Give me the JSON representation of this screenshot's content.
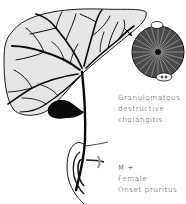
{
  "figure": {
    "colors": {
      "liver_fill": "#e6e6e6",
      "ink": "#0a0a0a",
      "section_fill": "#4a4a4a",
      "background": "#ffffff"
    },
    "icons": {
      "liver": "liver-outline",
      "biliary_tree": "bile-duct-tree",
      "gallbladder": "gallbladder-shape",
      "duodenum": "duodenum-loop",
      "bile_duct_section": "circular-cross-section",
      "pointer_arrow": "arrow-icon"
    }
  },
  "labels": {
    "pathology": {
      "line1": "Granulomatous",
      "line2": "destructive",
      "line3": "cholangitis"
    },
    "clinical": {
      "line1": "M +",
      "line2": "Female",
      "line3": "Onset pruritus"
    }
  }
}
